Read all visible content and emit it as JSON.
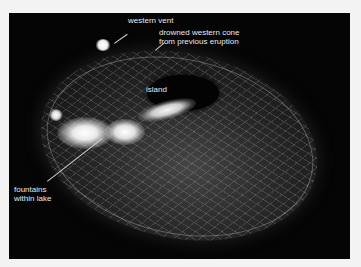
{
  "image": {
    "subject": "lava lake viewed from above with annotated features",
    "background_color": "#050505",
    "frame_color": "#f3f3f3"
  },
  "labels": {
    "western_vent": "western vent",
    "drowned_cone_line1": "drowned western cone",
    "drowned_cone_line2": "from previous eruption",
    "island": "island",
    "fountains_line1": "fountains",
    "fountains_line2": "within lake"
  }
}
